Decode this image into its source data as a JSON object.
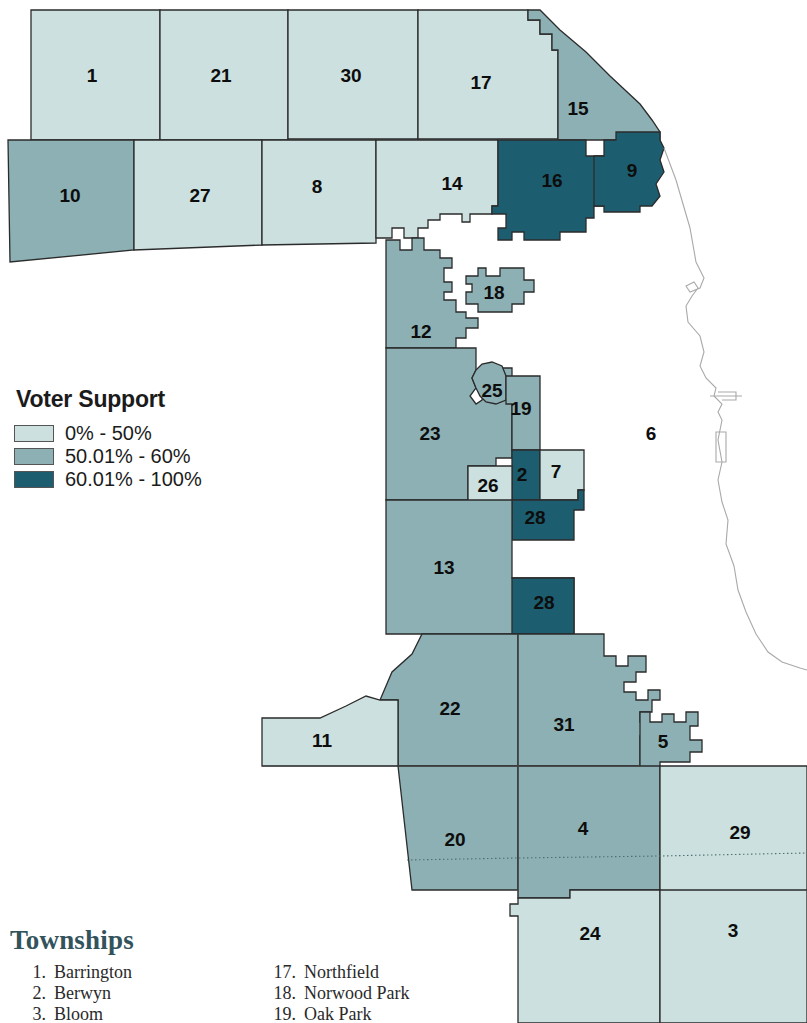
{
  "figure": {
    "kind": "choropleth-map",
    "background_color": "#ffffff"
  },
  "legend": {
    "title": "Voter Support",
    "classes": [
      {
        "label": "0% - 50%",
        "color": "#cbe0df",
        "key": "low"
      },
      {
        "label": "50.01% - 60%",
        "color": "#8cb0b4",
        "key": "mid"
      },
      {
        "label": "60.01% - 100%",
        "color": "#1c5e70",
        "key": "high"
      }
    ]
  },
  "townships_list": {
    "heading": "Townships",
    "column_left": [
      {
        "num": "1.",
        "name": "Barrington"
      },
      {
        "num": "2.",
        "name": "Berwyn"
      },
      {
        "num": "3.",
        "name": "Bloom"
      }
    ],
    "column_right": [
      {
        "num": "17.",
        "name": "Northfield"
      },
      {
        "num": "18.",
        "name": "Norwood Park"
      },
      {
        "num": "19.",
        "name": "Oak Park"
      }
    ]
  },
  "map": {
    "stroke_color": "#2b2b2b",
    "shoreline_color": "#a9a9a9",
    "label_color": "#0d0d0d",
    "regions": [
      {
        "id": "t1",
        "label": "1",
        "class": "low",
        "lx": 92,
        "ly": 77
      },
      {
        "id": "t21",
        "label": "21",
        "class": "low",
        "lx": 221,
        "ly": 77
      },
      {
        "id": "t30",
        "label": "30",
        "class": "low",
        "lx": 351,
        "ly": 77
      },
      {
        "id": "t17",
        "label": "17",
        "class": "low",
        "lx": 481,
        "ly": 84
      },
      {
        "id": "t15",
        "label": "15",
        "class": "mid",
        "lx": 578,
        "ly": 110
      },
      {
        "id": "t10",
        "label": "10",
        "class": "mid",
        "lx": 70,
        "ly": 197
      },
      {
        "id": "t27",
        "label": "27",
        "class": "low",
        "lx": 200,
        "ly": 197
      },
      {
        "id": "t8",
        "label": "8",
        "class": "low",
        "lx": 317,
        "ly": 188
      },
      {
        "id": "t14",
        "label": "14",
        "class": "low",
        "lx": 452,
        "ly": 185
      },
      {
        "id": "t16",
        "label": "16",
        "class": "high",
        "lx": 552,
        "ly": 182
      },
      {
        "id": "t9",
        "label": "9",
        "class": "high",
        "lx": 632,
        "ly": 172
      },
      {
        "id": "t18",
        "label": "18",
        "class": "mid",
        "lx": 494,
        "ly": 294
      },
      {
        "id": "t12",
        "label": "12",
        "class": "mid",
        "lx": 421,
        "ly": 333
      },
      {
        "id": "t25",
        "label": "25",
        "class": "mid",
        "lx": 492,
        "ly": 392
      },
      {
        "id": "t19",
        "label": "19",
        "class": "mid",
        "lx": 521,
        "ly": 410
      },
      {
        "id": "t23",
        "label": "23",
        "class": "mid",
        "lx": 430,
        "ly": 435
      },
      {
        "id": "t6",
        "label": "6",
        "class": "none",
        "lx": 651,
        "ly": 435
      },
      {
        "id": "t2",
        "label": "2",
        "class": "high",
        "lx": 522,
        "ly": 476
      },
      {
        "id": "t7",
        "label": "7",
        "class": "low",
        "lx": 556,
        "ly": 473
      },
      {
        "id": "t26",
        "label": "26",
        "class": "low",
        "lx": 488,
        "ly": 487
      },
      {
        "id": "t28a",
        "label": "28",
        "class": "high",
        "lx": 535,
        "ly": 519
      },
      {
        "id": "t13",
        "label": "13",
        "class": "mid",
        "lx": 444,
        "ly": 569
      },
      {
        "id": "t28b",
        "label": "28",
        "class": "high",
        "lx": 544,
        "ly": 604
      },
      {
        "id": "t22",
        "label": "22",
        "class": "mid",
        "lx": 450,
        "ly": 710
      },
      {
        "id": "t31",
        "label": "31",
        "class": "mid",
        "lx": 564,
        "ly": 726
      },
      {
        "id": "t11",
        "label": "11",
        "class": "low",
        "lx": 322,
        "ly": 742
      },
      {
        "id": "t5",
        "label": "5",
        "class": "mid",
        "lx": 663,
        "ly": 743
      },
      {
        "id": "t20",
        "label": "20",
        "class": "mid",
        "lx": 455,
        "ly": 841
      },
      {
        "id": "t4",
        "label": "4",
        "class": "mid",
        "lx": 583,
        "ly": 830
      },
      {
        "id": "t29",
        "label": "29",
        "class": "low",
        "lx": 740,
        "ly": 834
      },
      {
        "id": "t24",
        "label": "24",
        "class": "low",
        "lx": 590,
        "ly": 935
      },
      {
        "id": "t3",
        "label": "3",
        "class": "low",
        "lx": 733,
        "ly": 932
      }
    ]
  }
}
